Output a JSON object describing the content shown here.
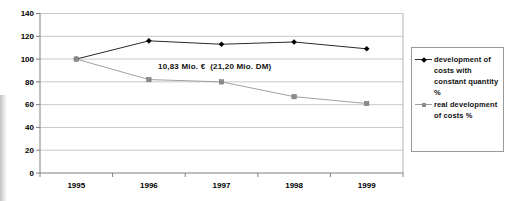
{
  "chart_data": {
    "type": "line",
    "title": "",
    "xlabel": "",
    "ylabel": "",
    "categories": [
      "1995",
      "1996",
      "1997",
      "1998",
      "1999"
    ],
    "series": [
      {
        "name": "development of costs with constant quantity %",
        "marker": "diamond",
        "line_color": "#2a2a2a",
        "marker_color": "#000000",
        "values": [
          100,
          116,
          113,
          115,
          109
        ]
      },
      {
        "name": "real development of costs %",
        "marker": "square",
        "line_color": "#a0a0a0",
        "marker_color": "#8c8c8c",
        "values": [
          100,
          82,
          80,
          67,
          61
        ]
      }
    ],
    "ylim": [
      0,
      140
    ],
    "yticks": [
      "0",
      "20",
      "40",
      "60",
      "80",
      "100",
      "120",
      "140"
    ],
    "grid": true,
    "legend_position": "right",
    "annotation": {
      "text": "10,83 Mio. €  (21,20 Mio. DM)"
    }
  },
  "legend": {
    "items": [
      {
        "label": "development of\ncosts with\nconstant quantity\n%",
        "marker": "diamond"
      },
      {
        "label": "real development\nof costs %",
        "marker": "square"
      }
    ]
  },
  "colors": {
    "gridline": "#c9c9c9",
    "axis": "#808080",
    "plot_border": "#b3b3b3",
    "text": "#000000",
    "background": "#ffffff"
  }
}
